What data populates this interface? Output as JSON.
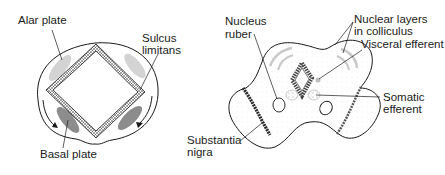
{
  "figure": {
    "left_panel": {
      "title": "Spinal cord cross-section",
      "labels": {
        "alar_plate": "Alar plate",
        "sulcus_limitans_1": "Sulcus",
        "sulcus_limitans_2": "limitans",
        "basal_plate": "Basal plate"
      }
    },
    "right_panel": {
      "title": "Midbrain cross-section",
      "labels": {
        "nucleus_ruber_1": "Nucleus",
        "nucleus_ruber_2": "ruber",
        "nuclear_layers_1": "Nuclear layers",
        "nuclear_layers_2": "in colliculus",
        "visceral_efferent": "Visceral efferent",
        "somatic_efferent_1": "Somatic",
        "somatic_efferent_2": "efferent",
        "substantia_nigra_1": "Substantia",
        "substantia_nigra_2": "nigra"
      }
    },
    "colors": {
      "outline": "#1a1a1a",
      "alar_fill": "#cfcfcf",
      "basal_fill": "#8f8f8f",
      "stipple": "#bdbdbd"
    }
  }
}
